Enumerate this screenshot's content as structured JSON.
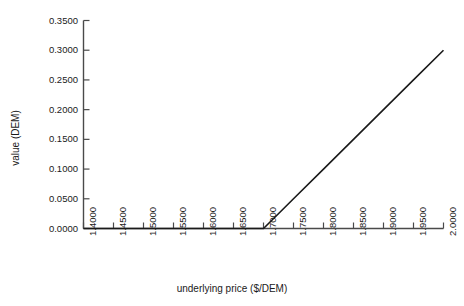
{
  "chart_data": {
    "type": "line",
    "title": "",
    "subtitle": "",
    "xlabel": "underlying price ($/DEM)",
    "ylabel": "value (DEM)",
    "xlim": [
      1.4,
      2.0
    ],
    "ylim": [
      0.0,
      0.35
    ],
    "grid": false,
    "legend": null,
    "legend_position": "none",
    "xticks": [
      "1.4000",
      "1.4500",
      "1.5000",
      "1.5500",
      "1.6000",
      "1.6500",
      "1.7000",
      "1.7500",
      "1.8000",
      "1.8500",
      "1.9000",
      "1.9500",
      "2.0000"
    ],
    "xtick_values": [
      1.4,
      1.45,
      1.5,
      1.55,
      1.6,
      1.65,
      1.7,
      1.75,
      1.8,
      1.85,
      1.9,
      1.95,
      2.0
    ],
    "yticks": [
      "0.0000",
      "0.0500",
      "0.1000",
      "0.1500",
      "0.2000",
      "0.2500",
      "0.3000",
      "0.3500"
    ],
    "ytick_values": [
      0.0,
      0.05,
      0.1,
      0.15,
      0.2,
      0.25,
      0.3,
      0.35
    ],
    "series": [
      {
        "name": "payoff",
        "color": "#1a1a1a",
        "x": [
          1.4,
          1.45,
          1.5,
          1.55,
          1.6,
          1.65,
          1.7,
          1.75,
          1.8,
          1.85,
          1.9,
          1.95,
          2.0
        ],
        "values": [
          0.0,
          0.0,
          0.0,
          0.0,
          0.0,
          0.0,
          0.0,
          0.05,
          0.1,
          0.15,
          0.2,
          0.25,
          0.3
        ]
      }
    ],
    "annotations": []
  },
  "axes": {
    "line_color": "#4a4a4a",
    "series_color": "#1a1a1a",
    "background": "#ffffff"
  }
}
